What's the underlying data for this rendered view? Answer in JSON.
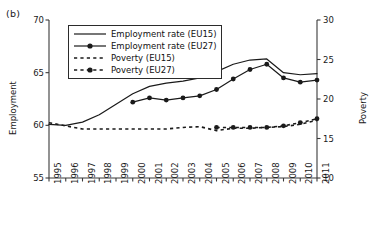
{
  "panel": {
    "label": "(b)"
  },
  "chart_data": {
    "type": "line",
    "title": "",
    "xlabel": "",
    "ylabel": "Employment",
    "y2label": "Poverty",
    "grid": false,
    "legend_position": "upper-left-inside",
    "x": [
      1995,
      1996,
      1997,
      1998,
      1999,
      2000,
      2001,
      2002,
      2003,
      2004,
      2005,
      2006,
      2007,
      2008,
      2009,
      2010,
      2011
    ],
    "categories": [
      "1995",
      "1996",
      "1997",
      "1998",
      "1999",
      "2000",
      "2001",
      "2002",
      "2003",
      "2004",
      "2005",
      "2006",
      "2007",
      "2008",
      "2009",
      "2010",
      "2011"
    ],
    "yticks_left": [
      55,
      60,
      65,
      70
    ],
    "ylim": [
      55,
      70
    ],
    "yticks_right": [
      10,
      15,
      20,
      25,
      30
    ],
    "y2lim": [
      10,
      30
    ],
    "series": [
      {
        "name": "Employment rate (EU15)",
        "axis": "left",
        "style": "solid",
        "markers": false,
        "color": "#1a1a1a",
        "x": [
          1995,
          1996,
          1997,
          1998,
          1999,
          2000,
          2001,
          2002,
          2003,
          2004,
          2005,
          2006,
          2007,
          2008,
          2009,
          2010,
          2011
        ],
        "values": [
          60.1,
          60.0,
          60.3,
          61.0,
          62.0,
          63.0,
          63.7,
          64.0,
          64.2,
          64.5,
          65.1,
          65.8,
          66.2,
          66.3,
          65.0,
          64.8,
          64.9
        ]
      },
      {
        "name": "Employment rate (EU27)",
        "axis": "left",
        "style": "solid",
        "markers": true,
        "color": "#1a1a1a",
        "x": [
          2000,
          2001,
          2002,
          2003,
          2004,
          2005,
          2006,
          2007,
          2008,
          2009,
          2010,
          2011
        ],
        "values": [
          62.2,
          62.6,
          62.4,
          62.6,
          62.8,
          63.4,
          64.4,
          65.3,
          65.8,
          64.5,
          64.1,
          64.3
        ]
      },
      {
        "name": "Poverty (EU15)",
        "axis": "right",
        "style": "dashed",
        "markers": false,
        "color": "#1a1a1a",
        "x": [
          1995,
          1996,
          1997,
          1998,
          1999,
          2000,
          2001,
          2002,
          2003,
          2004,
          2005,
          2006,
          2007,
          2008,
          2009,
          2010,
          2011
        ],
        "values": [
          17.0,
          16.6,
          16.2,
          16.2,
          16.2,
          16.2,
          16.2,
          16.2,
          16.4,
          16.5,
          16.0,
          16.3,
          16.3,
          16.4,
          16.5,
          16.8,
          17.3
        ]
      },
      {
        "name": "Poverty (EU27)",
        "axis": "right",
        "style": "dashed",
        "markers": true,
        "color": "#1a1a1a",
        "x": [
          2005,
          2006,
          2007,
          2008,
          2009,
          2010,
          2011
        ],
        "values": [
          16.4,
          16.4,
          16.4,
          16.4,
          16.6,
          17.0,
          17.5
        ]
      }
    ],
    "legend": [
      {
        "label": "Employment rate (EU15)",
        "style": "solid",
        "marker": false
      },
      {
        "label": "Employment rate (EU27)",
        "style": "solid",
        "marker": true
      },
      {
        "label": "Poverty (EU15)",
        "style": "dashed",
        "marker": false
      },
      {
        "label": "Poverty (EU27)",
        "style": "dashed",
        "marker": true
      }
    ]
  },
  "colors": {
    "ink": "#1a1a1a",
    "axis": "#3a3a3a",
    "background": "#ffffff"
  }
}
